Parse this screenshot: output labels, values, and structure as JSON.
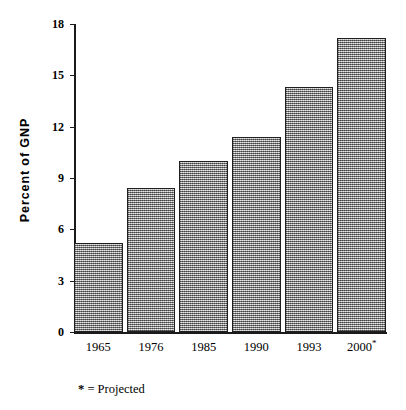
{
  "chart_data": {
    "type": "bar",
    "title": "",
    "subtitle": "",
    "xlabel": "",
    "ylabel": "Percent of GNP",
    "categories": [
      "1965",
      "1976",
      "1985",
      "1990",
      "1993",
      "2000*"
    ],
    "values": [
      5.2,
      8.4,
      10.0,
      11.4,
      14.3,
      17.2
    ],
    "ylim": [
      0,
      18
    ],
    "yticks": [
      0,
      3,
      6,
      9,
      12,
      15,
      18
    ],
    "ytick_labels": [
      "0",
      "3",
      "6",
      "9",
      "12",
      "15",
      "18"
    ],
    "grid": false,
    "legend": null,
    "annotations": [
      {
        "name": "footnote",
        "symbol": "*",
        "equals": "=",
        "text": "Projected"
      }
    ],
    "bar_style": {
      "fill": "#9c9c9c",
      "pattern": "checkerboard-dither-50",
      "edge_color": "#1f1f1f"
    }
  },
  "axes": {
    "y_title": "Percent of GNP",
    "axis_color": "#1b1b1b"
  },
  "footnote": {
    "star": "*",
    "equals": "=",
    "label": "Projected",
    "full": "* = Projected"
  }
}
